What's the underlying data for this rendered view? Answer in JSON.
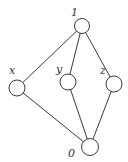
{
  "diagram": {
    "type": "hasse-diagram",
    "nodes": [
      {
        "id": "one",
        "label": "1",
        "cx": 82,
        "cy": 26,
        "r": 7.5,
        "label_x": 71,
        "label_y": 16
      },
      {
        "id": "x",
        "label": "x",
        "cx": 17,
        "cy": 88,
        "r": 8,
        "label_x": 9,
        "label_y": 74
      },
      {
        "id": "y",
        "label": "y",
        "cx": 68,
        "cy": 82,
        "r": 8,
        "label_x": 56,
        "label_y": 73
      },
      {
        "id": "z",
        "label": "z",
        "cx": 114,
        "cy": 84,
        "r": 8,
        "label_x": 100,
        "label_y": 74
      },
      {
        "id": "zero",
        "label": "0",
        "cx": 90,
        "cy": 147,
        "r": 8.5,
        "label_x": 68,
        "label_y": 157
      }
    ],
    "edges": [
      {
        "from": "one",
        "to": "x"
      },
      {
        "from": "one",
        "to": "y"
      },
      {
        "from": "one",
        "to": "z"
      },
      {
        "from": "x",
        "to": "zero"
      },
      {
        "from": "y",
        "to": "zero"
      },
      {
        "from": "z",
        "to": "zero"
      }
    ],
    "colors": {
      "stroke": "#3a3a3a",
      "fill": "#ffffff",
      "label": "#333333"
    }
  }
}
